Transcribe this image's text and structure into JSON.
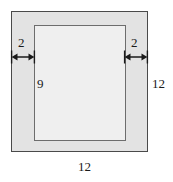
{
  "figure": {
    "shapes": {
      "outer": {
        "name": "outer-square",
        "side": 12,
        "fill": "#e3e3e3",
        "stroke": "#4a4a4a"
      },
      "inner": {
        "name": "inner-rectangle",
        "height": 9,
        "fill": "#efefef",
        "stroke": "#6d6d6d"
      },
      "border_band_width": 2
    },
    "labels": {
      "left_margin": "2",
      "right_margin": "2",
      "inner_height": "9",
      "outer_right_side": "12",
      "outer_bottom_side": "12"
    },
    "arrows": {
      "left": {
        "name": "left-dimension-arrow",
        "direction": "double-headed-horizontal"
      },
      "right": {
        "name": "right-dimension-arrow",
        "direction": "double-headed-horizontal"
      }
    }
  }
}
